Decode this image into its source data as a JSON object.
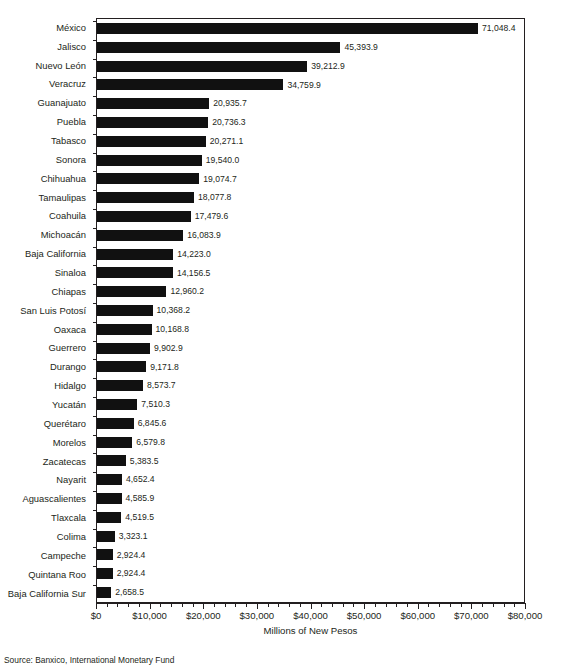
{
  "chart_data": {
    "type": "bar",
    "orientation": "horizontal",
    "title": "",
    "xlabel": "Millions of New Pesos",
    "ylabel": "",
    "xlim": [
      0,
      80000
    ],
    "grid": false,
    "legend": false,
    "tick_labels": [
      "$0",
      "$10,000",
      "$20,000",
      "$30,000",
      "$40,000",
      "$50,000",
      "$60,000",
      "$70,000",
      "$80,000"
    ],
    "tick_values": [
      0,
      10000,
      20000,
      30000,
      40000,
      50000,
      60000,
      70000,
      80000
    ],
    "minor_tick_step": 2000,
    "bar_color": "#111111",
    "categories": [
      "México",
      "Jalisco",
      "Nuevo León",
      "Veracruz",
      "Guanajuato",
      "Puebla",
      "Tabasco",
      "Sonora",
      "Chihuahua",
      "Tamaulipas",
      "Coahuila",
      "Michoacán",
      "Baja California",
      "Sinaloa",
      "Chiapas",
      "San Luis Potosí",
      "Oaxaca",
      "Guerrero",
      "Durango",
      "Hidalgo",
      "Yucatán",
      "Querétaro",
      "Morelos",
      "Zacatecas",
      "Nayarit",
      "Aguascalientes",
      "Tlaxcala",
      "Colima",
      "Campeche",
      "Quintana Roo",
      "Baja California Sur"
    ],
    "values": [
      71048.4,
      45393.9,
      39212.9,
      34759.9,
      20935.7,
      20736.3,
      20271.1,
      19540.0,
      19074.7,
      18077.8,
      17479.6,
      16083.9,
      14223.0,
      14156.5,
      12960.2,
      10368.2,
      10168.8,
      9902.9,
      9171.8,
      8573.7,
      7510.3,
      6845.6,
      6579.8,
      5383.5,
      4652.4,
      4585.9,
      4519.5,
      3323.1,
      2924.4,
      2924.4,
      2658.5
    ],
    "value_labels": [
      "71,048.4",
      "45,393.9",
      "39,212.9",
      "34,759.9",
      "20,935.7",
      "20,736.3",
      "20,271.1",
      "19,540.0",
      "19,074.7",
      "18,077.8",
      "17,479.6",
      "16,083.9",
      "14,223.0",
      "14,156.5",
      "12,960.2",
      "10,368.2",
      "10,168.8",
      "9,902.9",
      "9,171.8",
      "8,573.7",
      "7,510.3",
      "6,845.6",
      "6,579.8",
      "5,383.5",
      "4,652.4",
      "4,585.9",
      "4,519.5",
      "3,323.1",
      "2,924.4",
      "2,924.4",
      "2,658.5"
    ]
  },
  "footer": {
    "source": "Source: Banxico, International Monetary Fund"
  }
}
